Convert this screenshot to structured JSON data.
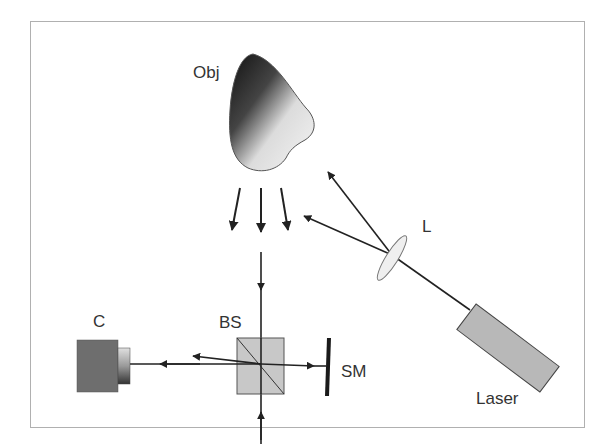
{
  "diagram": {
    "title": "",
    "components": [
      {
        "id": "obj",
        "label": "Obj",
        "kind": "object"
      },
      {
        "id": "lens",
        "label": "L",
        "kind": "lens"
      },
      {
        "id": "laser",
        "label": "Laser",
        "kind": "laser-source"
      },
      {
        "id": "camera",
        "label": "C",
        "kind": "camera"
      },
      {
        "id": "beamsplitter",
        "label": "BS",
        "kind": "beam-splitter"
      },
      {
        "id": "shift_mirror",
        "label": "SM",
        "kind": "mirror"
      },
      {
        "id": "mirror",
        "label": "M",
        "kind": "mirror"
      }
    ],
    "colors": {
      "frame": "#b0b0b0",
      "beam": "#222222",
      "label": "#333333",
      "camera_body": "#6e6e6e",
      "beamsplitter_fill": "#c8c8c8",
      "laser_fill": "#b4b4b4",
      "lens_fill": "#eeeeee",
      "mirror": "#1a1a1a"
    }
  },
  "labels": {
    "obj": "Obj",
    "lens": "L",
    "laser": "Laser",
    "camera": "C",
    "beamsplitter": "BS",
    "shift_mirror": "SM",
    "mirror": "M"
  }
}
